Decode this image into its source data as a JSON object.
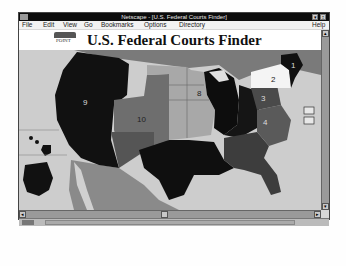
{
  "window": {
    "title": "Netscape - [U.S. Federal Courts Finder]",
    "minimize_label": "▾",
    "maximize_label": "↕"
  },
  "menubar": {
    "items": [
      {
        "label": "File"
      },
      {
        "label": "Edit"
      },
      {
        "label": "View"
      },
      {
        "label": "Go"
      },
      {
        "label": "Bookmarks"
      },
      {
        "label": "Options"
      },
      {
        "label": "Directory"
      }
    ],
    "help_label": "Help"
  },
  "page": {
    "logo_text": "POINT",
    "title": "U.S. Federal Courts Finder"
  },
  "map": {
    "circuits": [
      {
        "id": "9",
        "label": "9",
        "shade": "#111111"
      },
      {
        "id": "10",
        "label": "10",
        "shade": "#6e6e6e"
      },
      {
        "id": "8",
        "label": "8",
        "shade": "#a6a6a6"
      },
      {
        "id": "7",
        "label": "7",
        "shade": "#0d0d0d"
      },
      {
        "id": "6",
        "label": "6",
        "shade": "#151515"
      },
      {
        "id": "5",
        "label": "5",
        "shade": "#0f0f0f"
      },
      {
        "id": "4",
        "label": "4",
        "shade": "#5a5a5a"
      },
      {
        "id": "3",
        "label": "3",
        "shade": "#4a4a4a"
      },
      {
        "id": "2",
        "label": "2",
        "shade": "#f4f4f4"
      },
      {
        "id": "1",
        "label": "1",
        "shade": "#101010"
      },
      {
        "id": "11",
        "label": "11",
        "shade": "#3d3d3d"
      }
    ],
    "dc_buttons": [
      {
        "label": "DC"
      },
      {
        "label": "FC"
      }
    ]
  },
  "scroll": {
    "up": "▴",
    "down": "▾",
    "left": "◂",
    "right": "▸"
  }
}
